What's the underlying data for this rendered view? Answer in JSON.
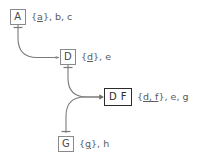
{
  "diagram": {
    "type": "closure-lattice",
    "nodes": [
      {
        "id": "A",
        "box_text": "A",
        "emphasis": false,
        "label_prefix": "{",
        "label_underlined": "a",
        "label_suffix": "}, b, c",
        "closure": [
          "a",
          "b",
          "c"
        ],
        "key": [
          "a"
        ],
        "x": 10,
        "y": 9,
        "w": 16,
        "h": 16
      },
      {
        "id": "D",
        "box_text": "D",
        "emphasis": false,
        "label_prefix": "{",
        "label_underlined": "d",
        "label_suffix": "}, e",
        "closure": [
          "d",
          "e"
        ],
        "key": [
          "d"
        ],
        "x": 60,
        "y": 49,
        "w": 16,
        "h": 16
      },
      {
        "id": "DF",
        "box_text": "D F",
        "emphasis": true,
        "label_prefix": "{",
        "label_underlined": "d, f",
        "label_suffix": "}, e, g",
        "closure": [
          "d",
          "f",
          "e",
          "g"
        ],
        "key": [
          "d",
          "f"
        ],
        "x": 104,
        "y": 88,
        "w": 28,
        "h": 18
      },
      {
        "id": "G",
        "box_text": "G",
        "emphasis": false,
        "label_prefix": "{",
        "label_underlined": "g",
        "label_suffix": "}, h",
        "closure": [
          "g",
          "h"
        ],
        "key": [
          "g"
        ],
        "x": 58,
        "y": 136,
        "w": 16,
        "h": 16
      }
    ],
    "edges": [
      {
        "id": "edge-a-d",
        "from": "A",
        "to": "D",
        "from_port": "bottom",
        "to_port": "left",
        "from_marker": "tee",
        "to_marker": "dot"
      },
      {
        "id": "edge-d-df",
        "from": "D",
        "to": "DF",
        "from_port": "bottom",
        "to_port": "left",
        "from_marker": "tee",
        "to_marker": "arrow"
      },
      {
        "id": "edge-df-g",
        "from": "DF",
        "to": "G",
        "from_port": "left",
        "to_port": "top",
        "from_marker": "arrow",
        "to_marker": "tee"
      }
    ],
    "colors": {
      "node_border": "#8a8a8a",
      "node_border_emphasis": "#2b2b2b",
      "node_text": "#4a4a4a",
      "label_text": "#5a5a5a",
      "edge": "#7a7a7a",
      "background": "#ffffff"
    }
  }
}
